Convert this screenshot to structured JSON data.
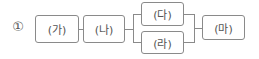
{
  "diagram": {
    "option_number": "①",
    "nodes": [
      {
        "id": "ga",
        "label": "(가)"
      },
      {
        "id": "na",
        "label": "(나)"
      },
      {
        "id": "da",
        "label": "(다)"
      },
      {
        "id": "ra",
        "label": "(라)"
      },
      {
        "id": "ma",
        "label": "(마)"
      }
    ],
    "edges": [
      {
        "from": "ga",
        "to": "na"
      },
      {
        "from": "na",
        "to": "da"
      },
      {
        "from": "na",
        "to": "ra"
      },
      {
        "from": "da",
        "to": "ma"
      },
      {
        "from": "ra",
        "to": "ma"
      }
    ],
    "structure": "(가) → (나) → [(다) ∥ (라)] → (마)"
  }
}
